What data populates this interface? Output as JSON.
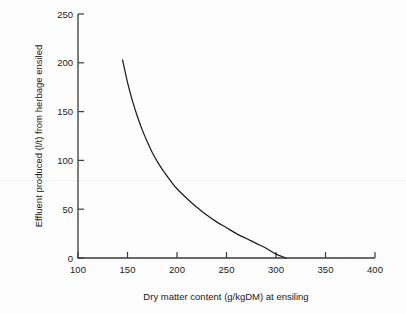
{
  "figure": {
    "background_color": "#fdfdfd",
    "line_color": "#1e1e1e",
    "axis_color": "#3a3a3a",
    "text_color": "#1a1a1a"
  },
  "chart_data": {
    "type": "line",
    "title": "",
    "subtitle": "",
    "xlabel": "Dry matter content (g/kgDM) at ensiling",
    "ylabel": "Effluent produced (l/t) from herbage ensiled",
    "xlim": [
      100,
      400
    ],
    "ylim": [
      0,
      250
    ],
    "xticks": [
      100,
      150,
      200,
      250,
      300,
      350,
      400
    ],
    "yticks": [
      0,
      50,
      100,
      150,
      200,
      250
    ],
    "xtick_labels": [
      "100",
      "150",
      "200",
      "250",
      "300",
      "350",
      "400"
    ],
    "ytick_labels": [
      "0",
      "50",
      "100",
      "150",
      "200",
      "250"
    ],
    "grid": false,
    "legend": false,
    "legend_position": "none",
    "annotations": [],
    "series": [
      {
        "name": "Effluent produced",
        "x": [
          145,
          150,
          155,
          160,
          165,
          170,
          175,
          180,
          185,
          190,
          195,
          200,
          210,
          220,
          230,
          240,
          250,
          260,
          270,
          280,
          290,
          300,
          305,
          310
        ],
        "y": [
          203,
          180,
          161,
          145,
          131,
          119,
          108,
          99,
          91,
          84,
          77,
          71,
          61,
          52,
          44,
          37,
          31,
          25,
          20,
          15,
          10,
          4,
          2,
          0
        ]
      }
    ]
  }
}
